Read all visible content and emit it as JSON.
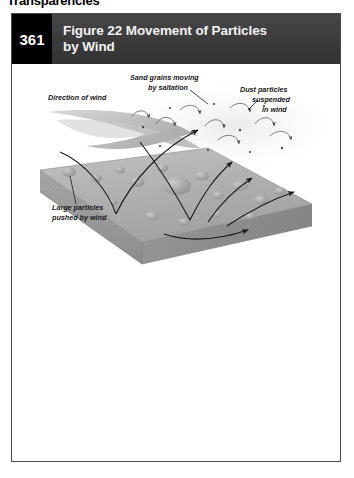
{
  "page_heading": "Transparencies",
  "figure": {
    "page_number": "361",
    "title_line1": "Figure 22 Movement of Particles",
    "title_line2": "by Wind",
    "title_full": "Figure 22 Movement of Particles by Wind"
  },
  "diagram": {
    "type": "illustration",
    "subject": "Movement of particles by wind",
    "labels": {
      "wind_direction": "Direction of wind",
      "saltation_line1": "Sand grains moving",
      "saltation_line2": "by saltation",
      "suspension_line1": "Dust particles",
      "suspension_line2": "suspended",
      "suspension_line3": "in wind",
      "creep_line1": "Large particles",
      "creep_line2": "pushed by wind"
    },
    "colors": {
      "header_bar": "#3b3b3b",
      "page_box": "#000000",
      "card_border": "#4a4a4a",
      "ground_top": "#b3b3b3",
      "ground_front": "#9a9a9a",
      "ground_side": "#8c8c8c",
      "wind_arrow": "#b9b9b9",
      "trajectory": "#1a1a1a",
      "dust_haze": "#f0f0f0"
    }
  }
}
